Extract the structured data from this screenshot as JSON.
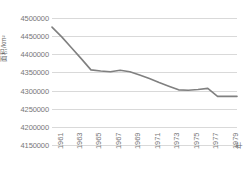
{
  "chart_data": {
    "type": "line",
    "title": "",
    "xlabel": "年",
    "ylabel": "面积/km²",
    "ylim": [
      4150000,
      4500000
    ],
    "ytick_step": 50000,
    "yticks": [
      4500000,
      4450000,
      4400000,
      4350000,
      4300000,
      4250000,
      4200000,
      4150000
    ],
    "ytick_labels": [
      "4500000",
      "4450000",
      "4400000",
      "4350000",
      "4300000",
      "4250000",
      "4200000",
      "4150000"
    ],
    "xlim": [
      1961,
      1980
    ],
    "xticks": [
      1961,
      1963,
      1965,
      1967,
      1969,
      1971,
      1973,
      1975,
      1977,
      1979
    ],
    "xtick_labels": [
      "1961",
      "1963",
      "1965",
      "1967",
      "1969",
      "1971",
      "1973",
      "1975",
      "1977",
      "1979"
    ],
    "grid": "horizontal",
    "legend": "none",
    "line_color": "#808080",
    "gridline_color": "#d9d9d9",
    "background_color": "#ffffff",
    "x": [
      1961,
      1962,
      1963,
      1964,
      1965,
      1966,
      1967,
      1968,
      1969,
      1970,
      1971,
      1972,
      1973,
      1974,
      1975,
      1976,
      1977,
      1978,
      1979,
      1980
    ],
    "values": [
      4475000,
      4448000,
      4418000,
      4388000,
      4357000,
      4354000,
      4352000,
      4356000,
      4352000,
      4343000,
      4333000,
      4322000,
      4312000,
      4302000,
      4301000,
      4303000,
      4306000,
      4284000,
      4284000,
      4284000
    ],
    "series": [
      {
        "name": "面积",
        "values": [
          4475000,
          4448000,
          4418000,
          4388000,
          4357000,
          4354000,
          4352000,
          4356000,
          4352000,
          4343000,
          4333000,
          4322000,
          4312000,
          4302000,
          4301000,
          4303000,
          4306000,
          4284000,
          4284000,
          4284000
        ]
      }
    ]
  }
}
